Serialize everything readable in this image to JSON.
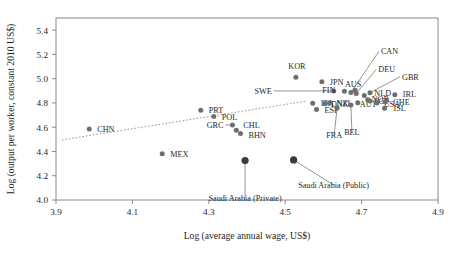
{
  "chart_data": {
    "type": "scatter",
    "title": "",
    "xlabel": "Log (average annual wage, US$)",
    "ylabel": "Log (output per worker, constant 2010 US$)",
    "xlim": [
      3.9,
      4.9
    ],
    "ylim": [
      4.0,
      5.5
    ],
    "xticks": [
      "3.9",
      "4.1",
      "4.3",
      "4.5",
      "4.7",
      "4.9"
    ],
    "xtick_values": [
      3.9,
      4.1,
      4.3,
      4.5,
      4.7,
      4.9
    ],
    "yticks": [
      "4.0",
      "4.2",
      "4.4",
      "4.6",
      "4.8",
      "5.0",
      "5.2",
      "5.4"
    ],
    "ytick_values": [
      4.0,
      4.2,
      4.4,
      4.6,
      4.8,
      5.0,
      5.2,
      5.4
    ],
    "grid": false,
    "legend": "none",
    "trendline": {
      "type": "dotted-linear",
      "x": [
        3.915,
        4.555
      ],
      "y": [
        4.495,
        4.815
      ]
    },
    "points": [
      {
        "label": "CHN",
        "x": 3.987,
        "y": 4.585,
        "label_dx": 8,
        "label_dy": 3,
        "anchor": "start"
      },
      {
        "label": "MEX",
        "x": 4.178,
        "y": 4.382,
        "label_dx": 8,
        "label_dy": 3,
        "anchor": "start"
      },
      {
        "label": "GRC",
        "x": 4.362,
        "y": 4.618,
        "label_dx": -9,
        "label_dy": 3,
        "anchor": "end",
        "leader": true
      },
      {
        "label": "CHL",
        "x": 4.372,
        "y": 4.575,
        "label_dx": 7,
        "label_dy": -2,
        "anchor": "start"
      },
      {
        "label": "BHN",
        "x": 4.383,
        "y": 4.548,
        "label_dx": 8,
        "label_dy": 4,
        "anchor": "start"
      },
      {
        "label": "PRT",
        "x": 4.279,
        "y": 4.739,
        "label_dx": 8,
        "label_dy": 3,
        "anchor": "start"
      },
      {
        "label": "POL",
        "x": 4.313,
        "y": 4.688,
        "label_dx": 8,
        "label_dy": 3,
        "anchor": "start"
      },
      {
        "label": "SWE",
        "x": 4.627,
        "y": 4.899,
        "label_dx": -62,
        "label_dy": 3,
        "anchor": "end",
        "leader": true
      },
      {
        "label": "KOR",
        "x": 4.528,
        "y": 5.012,
        "label_dx": 1,
        "label_dy": -8,
        "anchor": "middle"
      },
      {
        "label": "JPN",
        "x": 4.596,
        "y": 4.974,
        "label_dx": 8,
        "label_dy": 3,
        "anchor": "start"
      },
      {
        "label": "ITA",
        "x": 4.572,
        "y": 4.798,
        "label_dx": 8,
        "label_dy": 3,
        "anchor": "start"
      },
      {
        "label": "DNK",
        "x": 4.604,
        "y": 4.795,
        "label_dx": 6,
        "label_dy": 3,
        "anchor": "start"
      },
      {
        "label": "NZL",
        "x": 4.616,
        "y": 4.8,
        "label_dx": 7,
        "label_dy": 3,
        "anchor": "start"
      },
      {
        "label": "ESP",
        "x": 4.582,
        "y": 4.745,
        "label_dx": 8,
        "label_dy": 3,
        "anchor": "start"
      },
      {
        "label": "FIN",
        "x": 4.655,
        "y": 4.896,
        "label_dx": -9,
        "label_dy": 2,
        "anchor": "end"
      },
      {
        "label": "AUS",
        "x": 4.683,
        "y": 4.905,
        "label_dx": -2,
        "label_dy": -3,
        "anchor": "middle"
      },
      {
        "label": "CAN",
        "x": 4.672,
        "y": 4.886,
        "label_dx": 30,
        "label_dy": -38,
        "anchor": "start",
        "leader": true
      },
      {
        "label": "DEU",
        "x": 4.686,
        "y": 4.878,
        "label_dx": 22,
        "label_dy": -21,
        "anchor": "start",
        "leader": true
      },
      {
        "label": "GBR",
        "x": 4.722,
        "y": 4.884,
        "label_dx": 32,
        "label_dy": -13,
        "anchor": "start",
        "leader": true
      },
      {
        "label": "NLD",
        "x": 4.707,
        "y": 4.862,
        "label_dx": 10,
        "label_dy": 1,
        "anchor": "start"
      },
      {
        "label": "IRL",
        "x": 4.787,
        "y": 4.867,
        "label_dx": 8,
        "label_dy": 2,
        "anchor": "start"
      },
      {
        "label": "FRA",
        "x": 4.636,
        "y": 4.76,
        "label_dx": -3,
        "label_dy": 30,
        "anchor": "middle",
        "leader": true
      },
      {
        "label": "BEL",
        "x": 4.672,
        "y": 4.783,
        "label_dx": 1,
        "label_dy": 30,
        "anchor": "middle",
        "leader": true
      },
      {
        "label": "AUT",
        "x": 4.69,
        "y": 4.801,
        "label_dx": 2,
        "label_dy": 4,
        "anchor": "start"
      },
      {
        "label": "NOR",
        "x": 4.716,
        "y": 4.826,
        "label_dx": 4,
        "label_dy": 2,
        "anchor": "start"
      },
      {
        "label": "SGP",
        "x": 4.722,
        "y": 4.816,
        "label_dx": 4,
        "label_dy": 3,
        "anchor": "start"
      },
      {
        "label": "USA",
        "x": 4.74,
        "y": 4.8,
        "label_dx": 7,
        "label_dy": 4,
        "anchor": "start"
      },
      {
        "label": "CHE",
        "x": 4.762,
        "y": 4.808,
        "label_dx": 8,
        "label_dy": 3,
        "anchor": "start"
      },
      {
        "label": "ISL",
        "x": 4.76,
        "y": 4.756,
        "label_dx": 9,
        "label_dy": 3,
        "anchor": "start"
      },
      {
        "label": "Saudi Arabia (Private)",
        "x": 4.395,
        "y": 4.325,
        "label_dx": 0,
        "label_dy": 40,
        "anchor": "middle",
        "leader": true,
        "big": true
      },
      {
        "label": "Saudi Arabia (Public)",
        "x": 4.522,
        "y": 4.33,
        "label_dx": 40,
        "label_dy": 28,
        "anchor": "middle",
        "leader": true,
        "big": true
      }
    ]
  }
}
